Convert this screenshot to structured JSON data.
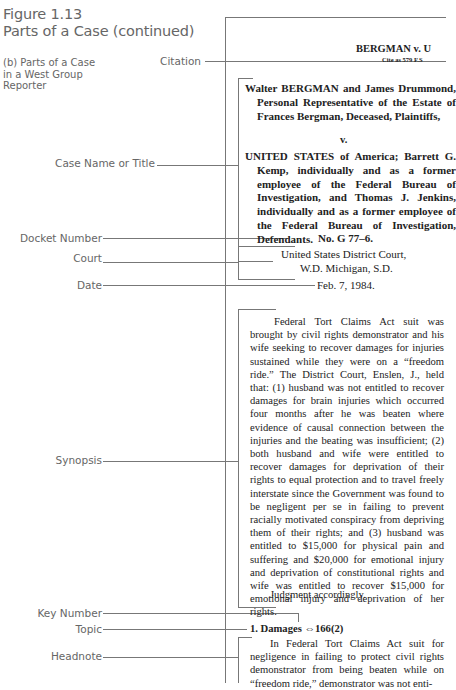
{
  "figure": {
    "title_line1": "Figure 1.13",
    "title_line2": "Parts of a Case (continued)",
    "subtitle": "(b) Parts of a Case in a West Group Reporter"
  },
  "labels": {
    "citation": "Citation",
    "case_name": "Case Name or Title",
    "docket_number": "Docket Number",
    "court": "Court",
    "date": "Date",
    "synopsis": "Synopsis",
    "key_number": "Key Number",
    "topic": "Topic",
    "headnote": "Headnote"
  },
  "case": {
    "running_head": "BERGMAN v. U",
    "cite_line": "Cite as 579 F.S",
    "plaintiffs": "Walter BERGMAN and James Drummond, Personal Representative of the Estate of Frances Bergman, Deceased, Plaintiffs,",
    "versus": "v.",
    "defendants": "UNITED STATES of America; Barrett G. Kemp, individually and as a former employee of the Federal Bureau of Investigation, and Thomas J. Jenkins, individually and as a former employee of the Federal Bureau of Investigation, Defendants.",
    "docket": "No. G 77–6.",
    "court_line1": "United States District Court,",
    "court_line2": "W.D. Michigan, S.D.",
    "date": "Feb. 7, 1984.",
    "synopsis": "Federal Tort Claims Act suit was brought by civil rights demonstrator and his wife seeking to recover damages for injuries sustained while they were on a “freedom ride.” The District Court, Enslen, J., held that: (1) husband was not entitled to recover damages for brain injuries which occurred four months after he was beaten where evidence of causal connection between the injuries and the beating was insufficient; (2) both husband and wife were entitled to recover damages for deprivation of their rights to equal protection and to travel freely interstate since the Government was found to be negligent per se in failing to prevent racially motivated conspiracy from depriving them of their rights; and (3) husband was entitled to $15,000 for physical pain and suffering and $20,000 for emotional injury and deprivation of constitutional rights and wife was entitled to recover $15,000 for emotional injury and deprivation of her rights.",
    "judgment": "Judgment accordingly.",
    "topic": "1. Damages ⇔166(2)",
    "headnote": "In Federal Tort Claims Act suit for negligence in failing to protect civil rights demonstrator from being beaten while on “freedom ride,” demonstrator was not enti-"
  }
}
